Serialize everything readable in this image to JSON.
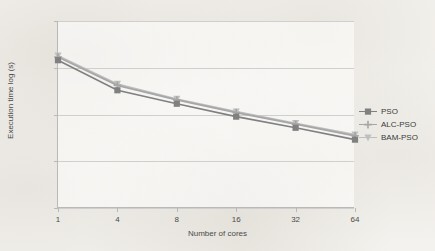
{
  "chart_data": {
    "type": "line",
    "title": "",
    "xlabel": "Number of cores",
    "ylabel": "Execution time log (s)",
    "x_scale": "category",
    "y_scale": "log",
    "ylim": [
      1,
      10000
    ],
    "grid": true,
    "legend_position": "right",
    "categories": [
      "1",
      "4",
      "8",
      "16",
      "32",
      "64"
    ],
    "y_ticks": [
      "1",
      "10",
      "100",
      "1000",
      "10000"
    ],
    "y_tick_values": [
      1,
      10,
      100,
      1000,
      10000
    ],
    "series": [
      {
        "name": "PSO",
        "marker": "square",
        "color": "#808080",
        "values": [
          1450,
          330,
          170,
          90,
          52,
          29
        ]
      },
      {
        "name": "ALC-PSO",
        "marker": "plus",
        "color": "#a6a6a6",
        "values": [
          1700,
          420,
          205,
          110,
          62,
          35
        ]
      },
      {
        "name": "BAM-PSO",
        "marker": "triangle",
        "color": "#bfbfbf",
        "values": [
          1800,
          450,
          215,
          115,
          65,
          37
        ]
      }
    ]
  },
  "legend": {
    "items": [
      {
        "label": "PSO",
        "marker": "square-marker",
        "color": "#808080"
      },
      {
        "label": "ALC-PSO",
        "marker": "plus-marker",
        "color": "#a6a6a6"
      },
      {
        "label": "BAM-PSO",
        "marker": "triangle-marker",
        "color": "#bfbfbf"
      }
    ]
  },
  "colors": {
    "background": "#f4f2ee",
    "plot_background": "#ffffff",
    "gridline": "#cfcfcf",
    "axis": "#b9b9b9",
    "text": "#4a4a4a"
  }
}
